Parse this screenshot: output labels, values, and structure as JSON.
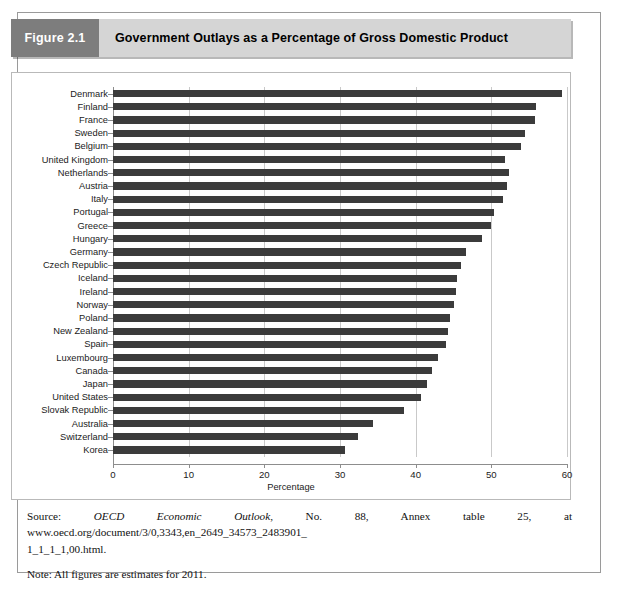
{
  "figure": {
    "number_label": "Figure 2.1",
    "title": "Government Outlays as a Percentage of Gross Domestic Product"
  },
  "chart_data": {
    "type": "bar",
    "orientation": "horizontal",
    "title": "Government Outlays as a Percentage of Gross Domestic Product",
    "xlabel": "Percentage",
    "ylabel": "",
    "xlim": [
      0,
      60
    ],
    "xticks": [
      0,
      10,
      20,
      30,
      40,
      50,
      60
    ],
    "xtick_labels": [
      "0",
      "10",
      "20",
      "30",
      "40",
      "50",
      "60"
    ],
    "grid": "vertical",
    "legend": "none",
    "bar_color": "#3b3b3b",
    "categories": [
      "Denmark",
      "Finland",
      "France",
      "Sweden",
      "Belgium",
      "United Kingdom",
      "Netherlands",
      "Austria",
      "Italy",
      "Portugal",
      "Greece",
      "Hungary",
      "Germany",
      "Czech Republic",
      "Iceland",
      "Ireland",
      "Norway",
      "Poland",
      "New Zealand",
      "Spain",
      "Luxembourg",
      "Canada",
      "Japan",
      "United States",
      "Slovak Republic",
      "Australia",
      "Switzerland",
      "Korea"
    ],
    "values": [
      59.4,
      55.9,
      55.8,
      54.5,
      53.9,
      51.8,
      52.4,
      52.1,
      51.5,
      50.3,
      49.9,
      48.8,
      46.7,
      46.0,
      45.5,
      45.3,
      45.0,
      44.6,
      44.3,
      44.0,
      42.9,
      42.2,
      41.5,
      40.7,
      38.4,
      34.3,
      32.4,
      30.6
    ]
  },
  "notes": {
    "source_prefix": "Source: ",
    "source_italic": "OECD Economic Outlook",
    "source_rest": ", No. 88, Annex table 25, at www.oecd.org/document/3/0,3343,en_2649_34573_2483901_",
    "source_line2": "1_1_1_1,00.html.",
    "note_text": "Note: All figures are estimates for 2011."
  }
}
